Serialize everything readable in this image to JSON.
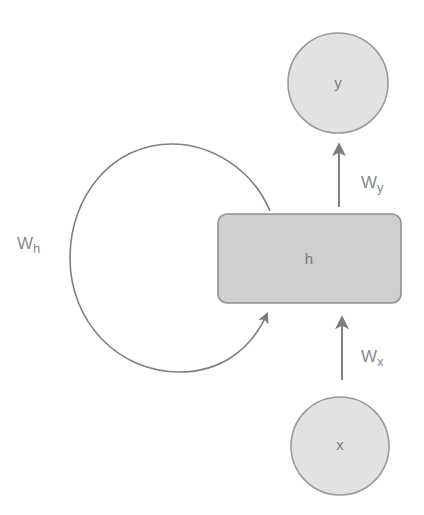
{
  "diagram": {
    "type": "recurrent-neural-network-unit",
    "colors": {
      "background": "#ffffff",
      "node_fill": "#e2e2e2",
      "node_stroke": "#9a9a9a",
      "hidden_fill": "#cfcfcf",
      "hidden_stroke": "#8f8f8f",
      "edge": "#808080",
      "text": "#7a7a7a"
    },
    "nodes": {
      "output": {
        "label": "y",
        "shape": "circle"
      },
      "hidden": {
        "label": "h",
        "shape": "rounded-rectangle"
      },
      "input": {
        "label": "x",
        "shape": "circle"
      }
    },
    "edges": {
      "input_to_hidden": {
        "weight_main": "W",
        "weight_sub": "x",
        "from": "x",
        "to": "h"
      },
      "hidden_to_output": {
        "weight_main": "W",
        "weight_sub": "y",
        "from": "h",
        "to": "y"
      },
      "hidden_recurrent": {
        "weight_main": "W",
        "weight_sub": "h",
        "from": "h",
        "to": "h"
      }
    }
  }
}
